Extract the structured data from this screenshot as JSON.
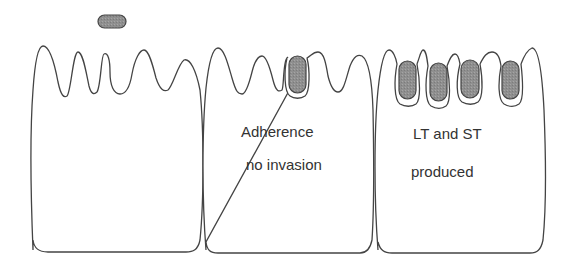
{
  "diagram": {
    "type": "schematic",
    "colors": {
      "outline": "#444444",
      "bacterium_fill": "#8c8c8c",
      "background": "#ffffff",
      "text": "#333333"
    },
    "cells": [
      {
        "id": "cell-1",
        "stage": "free bacterium above villi",
        "labels": [],
        "bacteria_count": 1
      },
      {
        "id": "cell-2",
        "stage": "adherence",
        "labels": [
          "Adherence",
          "no invasion"
        ],
        "bacteria_count": 1
      },
      {
        "id": "cell-3",
        "stage": "toxin production",
        "labels": [
          "LT and ST",
          "produced"
        ],
        "bacteria_count": 4
      }
    ]
  }
}
